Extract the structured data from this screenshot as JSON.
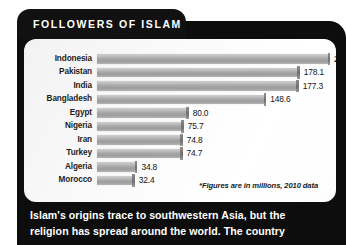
{
  "header": {
    "title": "FOLLOWERS OF ISLAM"
  },
  "chart_data": {
    "type": "bar",
    "title": "FOLLOWERS OF ISLAM",
    "xlabel": "",
    "ylabel": "",
    "orientation": "horizontal",
    "grid": false,
    "legend": null,
    "xlim": [
      0,
      204.8
    ],
    "units": "millions",
    "year": 2010,
    "note": "*Figures are in millions, 2010 data",
    "categories": [
      "Indonesia",
      "Pakistan",
      "India",
      "Bangladesh",
      "Egypt",
      "Nigeria",
      "Iran",
      "Turkey",
      "Algeria",
      "Morocco"
    ],
    "values": [
      204.8,
      178.1,
      177.3,
      148.6,
      80.0,
      75.7,
      74.8,
      74.7,
      34.8,
      32.4
    ],
    "labels": [
      "204.8*",
      "178.1",
      "177.3",
      "148.6",
      "80.0",
      "75.7",
      "74.8",
      "74.7",
      "34.8",
      "32.4"
    ],
    "rows": [
      {
        "label": "Indonesia",
        "value": 204.8,
        "display": "204.8*"
      },
      {
        "label": "Pakistan",
        "value": 178.1,
        "display": "178.1"
      },
      {
        "label": "India",
        "value": 177.3,
        "display": "177.3"
      },
      {
        "label": "Bangladesh",
        "value": 148.6,
        "display": "148.6"
      },
      {
        "label": "Egypt",
        "value": 80.0,
        "display": "80.0"
      },
      {
        "label": "Nigeria",
        "value": 75.7,
        "display": "75.7"
      },
      {
        "label": "Iran",
        "value": 74.8,
        "display": "74.8"
      },
      {
        "label": "Turkey",
        "value": 74.7,
        "display": "74.7"
      },
      {
        "label": "Algeria",
        "value": 34.8,
        "display": "34.8"
      },
      {
        "label": "Morocco",
        "value": 32.4,
        "display": "32.4"
      }
    ]
  },
  "footnote": "*Figures are in millions, 2010 data",
  "caption": {
    "line1": "Islam's origins trace to southwestern Asia, but the",
    "line2": "religion has spread around the world. The country"
  },
  "colors": {
    "panel": "#0d0d0d",
    "card": "#fbfbfb",
    "bar": "#a8a8a8",
    "text_dark": "#1c1c1c",
    "text_light": "#ffffff"
  }
}
